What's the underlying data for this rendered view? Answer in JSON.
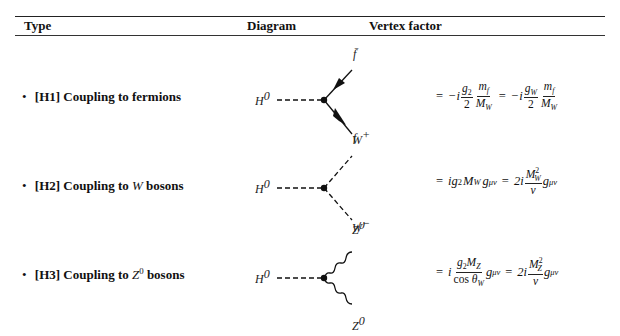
{
  "table": {
    "headers": [
      "Type",
      "Diagram",
      "Vertex factor"
    ],
    "rows": [
      {
        "id": "H1",
        "bullet": "•",
        "tag": "[H1]",
        "label_prefix": "Coupling to fermions",
        "label_math": "",
        "label_suffix": "",
        "diagram": {
          "incoming": "H",
          "incoming_sup": "0",
          "outgoing_top": "f̄",
          "outgoing_bottom": "f",
          "line_style": "fermion-arrows"
        },
        "vertex_factor": "= −i (g₂/2)(m_f/M_W) = −i (g_W/2)(m_f/M_W)"
      },
      {
        "id": "H2",
        "bullet": "•",
        "tag": "[H2]",
        "label_prefix": "Coupling to",
        "label_math": "W",
        "label_suffix": "bosons",
        "diagram": {
          "incoming": "H",
          "incoming_sup": "0",
          "outgoing_top": "W",
          "outgoing_top_sup": "+",
          "outgoing_bottom": "W",
          "outgoing_bottom_sup": "−",
          "line_style": "dashed"
        },
        "vertex_factor": "= i g₂ M_W g^μν = 2i (M_W²/v) g^μν"
      },
      {
        "id": "H3",
        "bullet": "•",
        "tag": "[H3]",
        "label_prefix": "Coupling to",
        "label_math": "Z",
        "label_math_sup": "0",
        "label_suffix": "bosons",
        "diagram": {
          "incoming": "H",
          "incoming_sup": "0",
          "outgoing_top": "Z",
          "outgoing_top_sup": "0",
          "outgoing_bottom": "Z",
          "outgoing_bottom_sup": "0",
          "line_style": "wavy"
        },
        "vertex_factor": "= i (g₂ M_Z / cos θ_W) g^μν = 2i (M_Z²/v) g^μν"
      }
    ]
  },
  "math": {
    "eq": "=",
    "minus_i": "−i",
    "i": "i",
    "two_i": "2i",
    "g2": "g",
    "g2_sub": "2",
    "gW": "g",
    "gW_sub": "W",
    "two": "2",
    "m": "m",
    "f_sub": "f",
    "M": "M",
    "W_sub": "W",
    "Z_sub": "Z",
    "sq": "2",
    "v": "v",
    "g": "g",
    "munu": "μν",
    "cos": "cos",
    "theta": "θ"
  }
}
